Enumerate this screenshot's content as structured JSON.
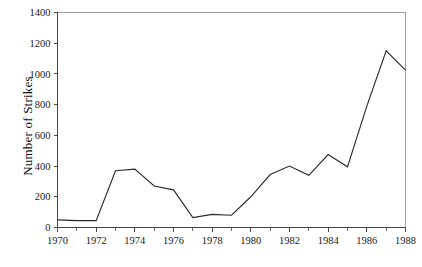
{
  "chart_data": {
    "type": "line",
    "title": "",
    "subtitle": "",
    "xlabel": "",
    "ylabel": "Number of Strikes",
    "x": [
      1970,
      1971,
      1972,
      1973,
      1974,
      1975,
      1976,
      1977,
      1978,
      1979,
      1980,
      1981,
      1982,
      1983,
      1984,
      1985,
      1986,
      1987,
      1988
    ],
    "values": [
      50,
      45,
      45,
      370,
      380,
      270,
      245,
      65,
      85,
      80,
      200,
      345,
      400,
      340,
      475,
      395,
      790,
      1150,
      1025
    ],
    "series": [
      {
        "name": "Number of Strikes",
        "values": [
          50,
          45,
          45,
          370,
          380,
          270,
          245,
          65,
          85,
          80,
          200,
          345,
          400,
          340,
          475,
          395,
          790,
          1150,
          1025
        ]
      }
    ],
    "xlim": [
      1970,
      1988
    ],
    "ylim": [
      0,
      1400
    ],
    "y_ticks": [
      0,
      200,
      400,
      600,
      800,
      1000,
      1200,
      1400
    ],
    "y_tick_labels": [
      "0",
      "200",
      "400",
      "600",
      "800",
      "1000",
      "1200",
      "1400"
    ],
    "x_ticks": [
      1970,
      1972,
      1974,
      1976,
      1978,
      1980,
      1982,
      1984,
      1986,
      1988
    ],
    "x_tick_labels": [
      "1970",
      "1972",
      "1974",
      "1976",
      "1978",
      "1980",
      "1982",
      "1984",
      "1986",
      "1988"
    ],
    "x_minor_ticks": [
      1971,
      1973,
      1975,
      1977,
      1979,
      1981,
      1983,
      1985,
      1987
    ],
    "grid": false,
    "legend": false,
    "legend_position": "none",
    "line_color": "#2b2b2b",
    "background_color": "#ffffff",
    "axis_color": "#333333",
    "frame_color": "#8a8a8a"
  }
}
